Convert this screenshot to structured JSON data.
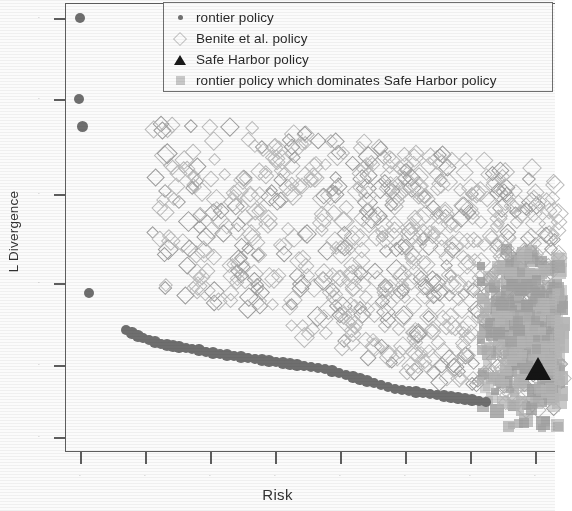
{
  "figure": {
    "xlabel": "Risk",
    "ylabel": "L Divergence",
    "note": "scanned figure, axis tick labels illegible"
  },
  "legend": {
    "items": [
      {
        "marker": "dot-icon",
        "label": "rontier policy"
      },
      {
        "marker": "diamond-icon",
        "label": "Benite  et al.    policy"
      },
      {
        "marker": "triangle-icon",
        "label": "Safe Harbor policy"
      },
      {
        "marker": "square-icon",
        "label": "rontier policy which dominates Safe Harbor policy"
      }
    ]
  },
  "chart_data": {
    "type": "scatter",
    "title": "",
    "xlabel": "Risk",
    "ylabel": "L Divergence",
    "grid": false,
    "legend_position": "top-right",
    "xlim": [
      0,
      1
    ],
    "ylim": [
      0,
      1
    ],
    "xticklabels": [
      "",
      "",
      "",
      "",
      "",
      "",
      "",
      ""
    ],
    "yticklabels": [
      "",
      "",
      "",
      "",
      "",
      ""
    ],
    "xtick_px": [
      80,
      145,
      210,
      275,
      340,
      405,
      470,
      535
    ],
    "ytick_px": [
      18,
      99,
      194,
      283,
      365,
      437
    ],
    "series": [
      {
        "name": "rontier policy",
        "marker": "filled-circle",
        "color": "#6b6b6b",
        "points_px": [
          [
            80,
            18
          ],
          [
            79,
            99
          ],
          [
            83,
            127
          ],
          [
            89,
            293
          ],
          [
            126,
            330
          ],
          [
            132,
            333
          ],
          [
            138,
            336
          ],
          [
            143,
            338
          ],
          [
            149,
            340
          ],
          [
            155,
            342
          ],
          [
            161,
            344
          ],
          [
            167,
            345
          ],
          [
            173,
            346
          ],
          [
            179,
            347
          ],
          [
            186,
            348
          ],
          [
            192,
            349
          ],
          [
            199,
            350
          ],
          [
            206,
            352
          ],
          [
            213,
            353
          ],
          [
            220,
            354
          ],
          [
            227,
            355
          ],
          [
            234,
            356
          ],
          [
            241,
            357
          ],
          [
            248,
            358
          ],
          [
            255,
            359
          ],
          [
            262,
            360
          ],
          [
            269,
            361
          ],
          [
            276,
            362
          ],
          [
            283,
            363
          ],
          [
            290,
            364
          ],
          [
            297,
            365
          ],
          [
            304,
            366
          ],
          [
            311,
            367
          ],
          [
            318,
            368
          ],
          [
            325,
            369
          ],
          [
            332,
            371
          ],
          [
            339,
            373
          ],
          [
            346,
            375
          ],
          [
            353,
            377
          ],
          [
            360,
            379
          ],
          [
            367,
            381
          ],
          [
            374,
            383
          ],
          [
            381,
            385
          ],
          [
            388,
            387
          ],
          [
            395,
            389
          ],
          [
            402,
            390
          ],
          [
            409,
            391
          ],
          [
            416,
            392
          ],
          [
            423,
            393
          ],
          [
            430,
            394
          ],
          [
            437,
            395
          ],
          [
            444,
            396
          ],
          [
            451,
            397
          ],
          [
            458,
            398
          ],
          [
            465,
            399
          ],
          [
            472,
            400
          ],
          [
            479,
            401
          ],
          [
            486,
            402
          ]
        ]
      },
      {
        "name": "Benite  et al.    policy",
        "marker": "open-diamond",
        "color": "#b5b5b5",
        "description": "broad diagonal cloud of hollow rotated squares spanning x 150-555, y 115-420, densest along a band descending left-to-right"
      },
      {
        "name": "Safe Harbor policy",
        "marker": "filled-triangle",
        "color": "#0d0d0d",
        "points_px": [
          [
            538,
            380
          ]
        ]
      },
      {
        "name": "rontier policy which dominates Safe Harbor policy",
        "marker": "filled-square",
        "color": "#a8a8a8",
        "description": "dense solid gray mass of overlapping squares at right edge, x 480-555, y 250-420"
      }
    ]
  }
}
